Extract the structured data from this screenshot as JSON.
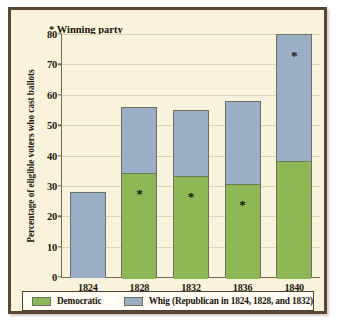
{
  "chart_data": {
    "type": "bar",
    "subtype": "stacked",
    "title": "",
    "xlabel": "",
    "ylabel": "Percentage of eligible voters who cast ballots",
    "ylim": [
      0,
      80
    ],
    "ytick_step": 10,
    "yticks": [
      "0",
      "10",
      "20",
      "30",
      "40",
      "50",
      "60",
      "70",
      "80"
    ],
    "grid": true,
    "categories": [
      "1824",
      "1828",
      "1832",
      "1836",
      "1840"
    ],
    "series": [
      {
        "name": "Democratic",
        "color": "#8eb755",
        "values": [
          0,
          34.5,
          33.5,
          31,
          38.5
        ]
      },
      {
        "name": "Whig (Republican in 1824, 1828, and 1832)",
        "color": "#9aafc6",
        "values": [
          28,
          21.5,
          21.5,
          27,
          41.5
        ]
      }
    ],
    "totals": [
      28,
      56,
      55,
      58,
      80
    ],
    "annotations": {
      "winning_party_note": "* Winning party",
      "winner_marker": "*",
      "winners": [
        "",
        "Democratic",
        "Democratic",
        "Democratic",
        "Whig"
      ]
    },
    "legend": {
      "position": "bottom",
      "entries": [
        {
          "label": "Democratic",
          "color": "#8eb755"
        },
        {
          "label": "Whig (Republican in 1824, 1828, and 1832)",
          "color": "#9aafc6"
        }
      ]
    },
    "colors": {
      "background": "#f9f2dd",
      "frame": "#5b4636",
      "axis": "#7a6a52",
      "gridline": "#ded3b4",
      "democratic": "#8eb755",
      "whig": "#9aafc6",
      "text": "#231a10"
    }
  }
}
